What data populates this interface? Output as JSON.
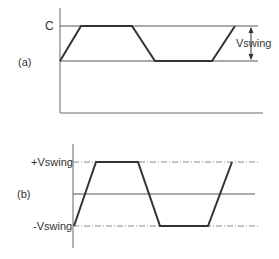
{
  "diagram": {
    "panel_a": {
      "label": "(a)",
      "top_level_label": "C",
      "swing_label": "Vswing",
      "waveform_points": [
        [
          60,
          61
        ],
        [
          81,
          26
        ],
        [
          132,
          26
        ],
        [
          155,
          61
        ],
        [
          212,
          61
        ],
        [
          235,
          26
        ]
      ],
      "top_line": {
        "x1": 60,
        "x2": 258,
        "y": 26
      },
      "mid_line": {
        "x1": 60,
        "x2": 258,
        "y": 61
      },
      "axis": {
        "x": 60,
        "y_top": 8,
        "y_bottom": 113,
        "x_end": 263
      }
    },
    "panel_b": {
      "label": "(b)",
      "pos_label": "+Vswing",
      "neg_label": "-Vswing",
      "waveform_points": [
        [
          74,
          226
        ],
        [
          96,
          162
        ],
        [
          138,
          162
        ],
        [
          160,
          226
        ],
        [
          208,
          226
        ],
        [
          232,
          162
        ]
      ],
      "pos_line": {
        "x1": 73,
        "x2": 258,
        "y": 162
      },
      "zero_line": {
        "x1": 73,
        "x2": 255,
        "y": 194
      },
      "neg_line": {
        "x1": 73,
        "x2": 258,
        "y": 226
      },
      "axis": {
        "x": 73,
        "y_top": 144,
        "y_bottom": 248
      }
    },
    "colors": {
      "waveform": "#333333",
      "axis": "#9a9a9a",
      "text": "#333333"
    }
  }
}
